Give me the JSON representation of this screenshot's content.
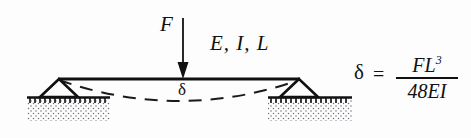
{
  "figure": {
    "background_color": "#fdfdfd",
    "ink_color": "#111111"
  },
  "labels": {
    "force": "F",
    "beam_properties": "E, I, L",
    "deflection_symbol": "δ",
    "equation_lhs": "δ",
    "equals": "=",
    "numerator": "FL",
    "numerator_exponent": "3",
    "denominator": "48EI"
  },
  "geometry": {
    "beam": {
      "x1": 58,
      "y1": 79,
      "x2": 300,
      "y2": 79,
      "stroke_width": 3
    },
    "load_arrow": {
      "x": 183,
      "y_start": 18,
      "y_end": 78
    },
    "left_support": {
      "apex_x": 59,
      "apex_y": 79,
      "base_y": 97,
      "half_width": 19
    },
    "right_support": {
      "apex_x": 299,
      "apex_y": 79,
      "base_y": 97,
      "half_width": 19
    },
    "ground_left": {
      "x1": 27,
      "x2": 110,
      "y": 97
    },
    "ground_right": {
      "x1": 268,
      "x2": 352,
      "y": 97
    },
    "deflection_curve": {
      "start_x": 59,
      "start_y": 80,
      "mid_x": 180,
      "mid_y": 104,
      "end_x": 299,
      "end_y": 80
    },
    "fraction_bar": {
      "x1": 398,
      "x2": 456,
      "y": 80
    }
  }
}
